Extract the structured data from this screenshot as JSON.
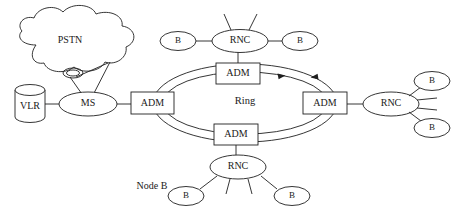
{
  "diagram": {
    "colors": {
      "stroke": "#1f1f1f",
      "fill": "#ffffff",
      "background": "#ffffff"
    },
    "nodes": {
      "pstn": {
        "label": "PSTN",
        "shape": "cloud"
      },
      "vlr": {
        "label": "VLR",
        "shape": "cylinder"
      },
      "ms": {
        "label": "MS",
        "shape": "ellipse"
      },
      "adm_left": {
        "label": "ADM",
        "shape": "rect"
      },
      "adm_top": {
        "label": "ADM",
        "shape": "rect"
      },
      "adm_right": {
        "label": "ADM",
        "shape": "rect"
      },
      "adm_bottom": {
        "label": "ADM",
        "shape": "rect"
      },
      "ring": {
        "label": "Ring",
        "shape": "text"
      },
      "rnc_top": {
        "label": "RNC",
        "shape": "ellipse"
      },
      "rnc_right": {
        "label": "RNC",
        "shape": "ellipse"
      },
      "rnc_bottom": {
        "label": "RNC",
        "shape": "ellipse"
      },
      "b_top_left": {
        "label": "B",
        "shape": "ellipse"
      },
      "b_top_right": {
        "label": "B",
        "shape": "ellipse"
      },
      "b_right_upper": {
        "label": "B",
        "shape": "ellipse"
      },
      "b_right_lower": {
        "label": "B",
        "shape": "ellipse"
      },
      "b_bottom_left": {
        "label": "B",
        "shape": "ellipse"
      },
      "b_bottom_right": {
        "label": "B",
        "shape": "ellipse"
      },
      "node_b_annotation": {
        "label": "Node B",
        "shape": "text"
      }
    }
  }
}
